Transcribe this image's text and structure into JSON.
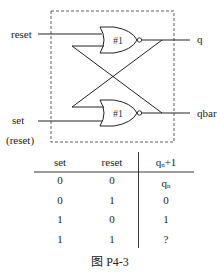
{
  "diagram": {
    "inputs": {
      "reset_label": "reset",
      "set_label": "set",
      "set_alt_label": "(reset)"
    },
    "outputs": {
      "q_label": "q",
      "qbar_label": "qbar"
    },
    "gates": [
      {
        "id": "top",
        "type": "NOR",
        "label": "#1"
      },
      {
        "id": "bottom",
        "type": "NOR",
        "label": "#1"
      }
    ]
  },
  "truth_table": {
    "headers": [
      "set",
      "reset",
      "qn+1"
    ],
    "header_q_main": "q",
    "header_q_sub": "n",
    "header_q_suffix": "+1",
    "rows": [
      {
        "set": "0",
        "reset": "0",
        "q_main": "q",
        "q_sub": "n"
      },
      {
        "set": "0",
        "reset": "1",
        "q_main": "0",
        "q_sub": ""
      },
      {
        "set": "1",
        "reset": "0",
        "q_main": "1",
        "q_sub": ""
      },
      {
        "set": "1",
        "reset": "1",
        "q_main": "?",
        "q_sub": ""
      }
    ]
  },
  "caption": "图 P4-3"
}
